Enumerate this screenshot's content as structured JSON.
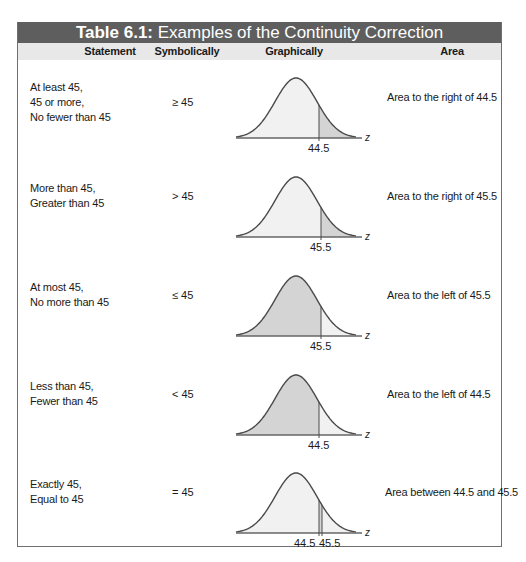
{
  "table": {
    "title_prefix": "Table 6.1:",
    "title_text": " Examples of the Continuity Correction",
    "columns": [
      "Statement",
      "Symbolically",
      "Graphically",
      "Area"
    ],
    "rows": [
      {
        "statement": [
          "At least 45,",
          "45 or more,",
          "No fewer than 45"
        ],
        "symbol": "≥ 45",
        "shade": "right",
        "cut_labels": [
          "44.5"
        ],
        "axis_label": "z",
        "area": "Area to the right of 44.5"
      },
      {
        "statement": [
          "More than 45,",
          "Greater than 45"
        ],
        "symbol": "> 45",
        "shade": "right",
        "cut_labels": [
          "45.5"
        ],
        "axis_label": "z",
        "area": "Area to the right of 45.5"
      },
      {
        "statement": [
          "At most 45,",
          "No more than 45"
        ],
        "symbol": "≤ 45",
        "shade": "left",
        "cut_labels": [
          "45.5"
        ],
        "axis_label": "z",
        "area": "Area to the left of 45.5"
      },
      {
        "statement": [
          "Less than 45,",
          "Fewer than 45"
        ],
        "symbol": "< 45",
        "shade": "left",
        "cut_labels": [
          "44.5"
        ],
        "axis_label": "z",
        "area": "Area to the left of 44.5"
      },
      {
        "statement": [
          "Exactly 45,",
          "Equal to 45"
        ],
        "symbol": "= 45",
        "shade": "between",
        "cut_labels": [
          "44.5",
          "45.5"
        ],
        "axis_label": "z",
        "area": "Area between 44.5 and 45.5"
      }
    ]
  },
  "colors": {
    "title_bar": "#5e5e5e",
    "header_row": "#e8e8e8",
    "curve_fill": "#f1f1f1",
    "shade_fill": "#d4d4d4",
    "curve_stroke": "#4a4a4a"
  }
}
